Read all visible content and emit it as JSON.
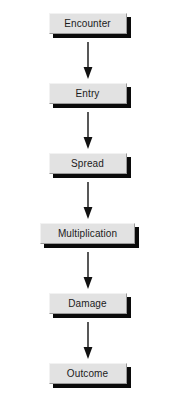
{
  "diagram": {
    "type": "vertical-flowchart",
    "orientation": "top-to-bottom",
    "background_color": "#ffffff",
    "node_fill_color": "#e2e2e2",
    "node_border_color": "#9a9a9a",
    "node_shadow_color": "#0b0b0b",
    "arrow_color": "#111111",
    "nodes": [
      {
        "id": "encounter",
        "label": "Encounter",
        "width": "standard"
      },
      {
        "id": "entry",
        "label": "Entry",
        "width": "standard"
      },
      {
        "id": "spread",
        "label": "Spread",
        "width": "standard"
      },
      {
        "id": "multiplication",
        "label": "Multiplication",
        "width": "wide"
      },
      {
        "id": "damage",
        "label": "Damage",
        "width": "standard"
      },
      {
        "id": "outcome",
        "label": "Outcome",
        "width": "standard"
      }
    ],
    "connectors": [
      {
        "from": "encounter",
        "to": "entry",
        "style": "arrow-down"
      },
      {
        "from": "entry",
        "to": "spread",
        "style": "arrow-down"
      },
      {
        "from": "spread",
        "to": "multiplication",
        "style": "arrow-down"
      },
      {
        "from": "multiplication",
        "to": "damage",
        "style": "arrow-down"
      },
      {
        "from": "damage",
        "to": "outcome",
        "style": "arrow-down"
      }
    ]
  }
}
